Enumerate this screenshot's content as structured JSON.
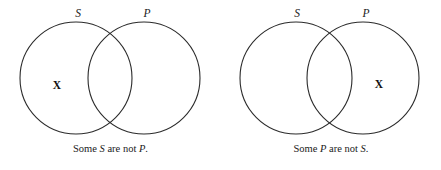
{
  "figure": {
    "background_color": "#ffffff",
    "stroke_color": "#2b2b2b",
    "text_color": "#1a1a1a",
    "diagrams": [
      {
        "id": "left",
        "left_circle": {
          "label": "S",
          "cx": 76,
          "cy": 78,
          "r": 56
        },
        "right_circle": {
          "label": "P",
          "cx": 144,
          "cy": 78,
          "r": 56
        },
        "left_label": "S",
        "right_label": "P",
        "x_marker": "X",
        "x_marker_region": "S-only",
        "caption_prefix": "Some ",
        "caption_subject": "S",
        "caption_middle": " are not ",
        "caption_predicate": "P",
        "caption_suffix": ".",
        "caption_full": "Some S are not P."
      },
      {
        "id": "right",
        "left_circle": {
          "label": "S",
          "cx": 296,
          "cy": 78,
          "r": 56
        },
        "right_circle": {
          "label": "P",
          "cx": 363,
          "cy": 78,
          "r": 56
        },
        "left_label": "S",
        "right_label": "P",
        "x_marker": "X",
        "x_marker_region": "P-only",
        "caption_prefix": "Some ",
        "caption_subject": "P",
        "caption_middle": " are not ",
        "caption_predicate": "S",
        "caption_suffix": ".",
        "caption_full": "Some P are not S."
      }
    ]
  }
}
